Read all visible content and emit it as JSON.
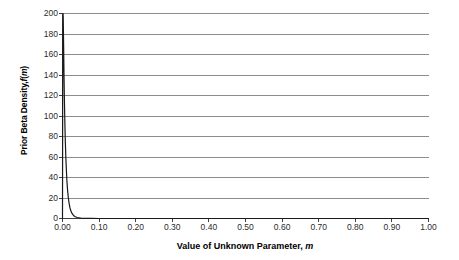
{
  "chart_data": {
    "type": "line",
    "title": "",
    "xlabel": "Value of Unknown Parameter, m",
    "xlabel_plain": "Value of Unknown Parameter,",
    "xlabel_symbol": "m",
    "ylabel": "Prior Beta Density, f(m)",
    "ylabel_plain_1": "Prior Beta Density,",
    "ylabel_symbol_1": "f",
    "ylabel_paren_open": "(",
    "ylabel_symbol_2": "m",
    "ylabel_paren_close": ")",
    "xlim": [
      0.0,
      1.0
    ],
    "ylim": [
      0,
      200
    ],
    "grid": true,
    "grid_axis": "y",
    "legend": false,
    "legend_position": "none",
    "x_ticks": [
      0.0,
      0.1,
      0.2,
      0.3,
      0.4,
      0.5,
      0.6,
      0.7,
      0.8,
      0.9,
      1.0
    ],
    "x_tick_labels": [
      "0.00",
      "0.10",
      "0.20",
      "0.30",
      "0.40",
      "0.50",
      "0.60",
      "0.70",
      "0.80",
      "0.90",
      "1.00"
    ],
    "y_ticks": [
      0,
      20,
      40,
      60,
      80,
      100,
      120,
      140,
      160,
      180,
      200
    ],
    "y_tick_labels": [
      "0",
      "20",
      "40",
      "60",
      "80",
      "100",
      "120",
      "140",
      "160",
      "180",
      "200"
    ],
    "series": [
      {
        "name": "Prior Beta Density",
        "color": "#1a1a1a",
        "x": [
          0.0,
          0.0005,
          0.001,
          0.0015,
          0.002,
          0.003,
          0.004,
          0.005,
          0.006,
          0.007,
          0.008,
          0.009,
          0.01,
          0.012,
          0.014,
          0.016,
          0.018,
          0.02,
          0.023,
          0.026,
          0.03,
          0.035,
          0.04,
          0.05,
          0.06,
          0.08,
          0.1,
          0.15,
          0.2,
          0.3,
          0.4,
          0.5,
          0.6,
          0.7,
          0.8,
          0.9,
          1.0
        ],
        "y": [
          0,
          124,
          186,
          200,
          196,
          170,
          143,
          120,
          101,
          85,
          72,
          61,
          52,
          37,
          27,
          20,
          15,
          11,
          7.2,
          4.9,
          3.0,
          1.7,
          1.0,
          0.4,
          0.2,
          0.06,
          0.02,
          0.005,
          0.002,
          0.0005,
          0.0002,
          0.0001,
          5e-05,
          2e-05,
          1e-05,
          5e-06,
          0
        ]
      }
    ]
  },
  "style": {
    "grid_color": "#8c8c8c",
    "axis_color": "#3f3f3f",
    "line_color": "#1a1a1a",
    "tick_label_color": "#2b2b2b",
    "background": "#ffffff"
  }
}
